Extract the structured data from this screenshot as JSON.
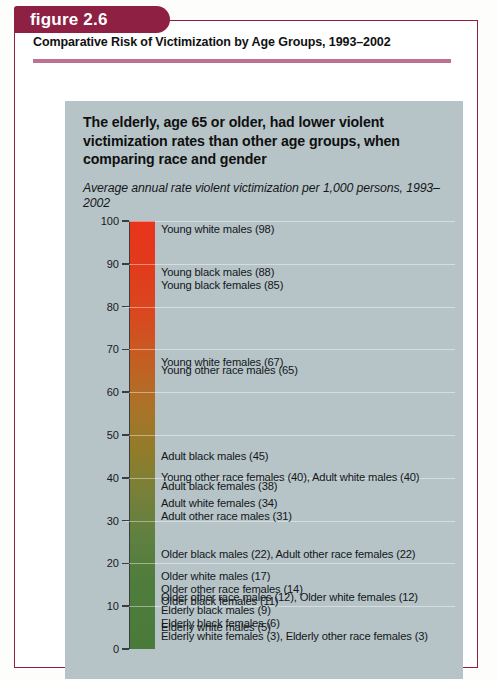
{
  "figure": {
    "tab_label": "figure 2.6",
    "title": "Comparative Risk of Victimization by Age Groups, 1993–2002",
    "tab_color": "#8e2044",
    "rule_color": "#bb7390",
    "panel_color": "#b6c4c8"
  },
  "panel": {
    "headline": "The elderly, age 65 or older, had lower violent victimization rates than other age groups, when comparing race and gender",
    "subtitle": "Average annual rate violent victimization per 1,000 persons, 1993–2002"
  },
  "chart_data": {
    "type": "bar",
    "title": "The elderly, age 65 or older, had lower violent victimization rates than other age groups, when comparing race and gender",
    "subtitle": "Average annual rate violent victimization per 1,000 persons, 1993–2002",
    "xlabel": "",
    "ylabel": "Average annual rate violent victimization per 1,000 persons",
    "ylim": [
      0,
      100
    ],
    "grid": true,
    "legend": "none",
    "yticks": [
      0,
      10,
      20,
      30,
      40,
      50,
      60,
      70,
      80,
      90,
      100
    ],
    "gradient": {
      "top_color": "#e8341b",
      "mid_color": "#8e7d2c",
      "bottom_color": "#4a7a3a",
      "description": "single vertical gradient column from red (high rate) to green (low rate)"
    },
    "categories": [
      "Young white males",
      "Young black males",
      "Young black females",
      "Young white females",
      "Young other race males",
      "Adult black males",
      "Young other race females",
      "Adult white males",
      "Adult black females",
      "Adult white females",
      "Adult other race males",
      "Older black males",
      "Adult other race females",
      "Older white males",
      "Older other race females",
      "Older other race males",
      "Older white females",
      "Older black females",
      "Elderly black males",
      "Elderly black females",
      "Elderly white males",
      "Elderly white females",
      "Elderly other race females"
    ],
    "values": [
      98,
      88,
      85,
      67,
      65,
      45,
      40,
      40,
      38,
      34,
      31,
      22,
      22,
      17,
      14,
      12,
      12,
      11,
      9,
      6,
      5,
      3,
      3
    ],
    "annotations": [
      {
        "value": 98,
        "text": "Young white males (98)"
      },
      {
        "value": 88,
        "text": "Young black males (88)"
      },
      {
        "value": 85,
        "text": "Young black females (85)"
      },
      {
        "value": 67,
        "text": "Young white females (67)"
      },
      {
        "value": 65,
        "text": "Young other race males (65)"
      },
      {
        "value": 45,
        "text": "Adult black males (45)"
      },
      {
        "value": 40,
        "text": "Young other race females (40), Adult white males (40)"
      },
      {
        "value": 38,
        "text": "Adult black females (38)"
      },
      {
        "value": 34,
        "text": "Adult white females (34)"
      },
      {
        "value": 31,
        "text": "Adult other race males (31)"
      },
      {
        "value": 22,
        "text": "Older black males (22), Adult other race females (22)"
      },
      {
        "value": 17,
        "text": "Older white males (17)"
      },
      {
        "value": 14,
        "text": "Older other race females (14)"
      },
      {
        "value": 12,
        "text": "Older other race males (12), Older white females (12)"
      },
      {
        "value": 11,
        "text": "Older black females (11)"
      },
      {
        "value": 9,
        "text": "Elderly black males (9)"
      },
      {
        "value": 6,
        "text": "Elderly black females (6)"
      },
      {
        "value": 5,
        "text": "Elderly white males (5)"
      },
      {
        "value": 3,
        "text": "Elderly white females (3), Elderly other race females (3)"
      }
    ]
  }
}
